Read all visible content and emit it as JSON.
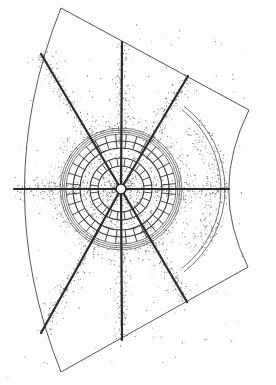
{
  "figure": {
    "style": "pen-and-ink line drawing with stipple shading",
    "colors": {
      "background": "#ffffff",
      "outline": "#444444",
      "rib": "#2a2a2a",
      "ring": "#3a3a3a",
      "stipple": "#7a7a7a"
    },
    "center": [
      121,
      189
    ],
    "sector_outline": {
      "top_left": [
        61,
        8
      ],
      "top_right": [
        249,
        110
      ],
      "bottom_right": [
        248,
        267
      ],
      "bottom_left": [
        61,
        372
      ],
      "left_arc_mid": [
        14,
        190
      ],
      "right_arc_mid": [
        229,
        190
      ]
    },
    "ribs": [
      {
        "name": "north",
        "to": [
          122,
          42
        ]
      },
      {
        "name": "north-west",
        "to": [
          41,
          54
        ]
      },
      {
        "name": "north-east",
        "to": [
          188,
          76
        ]
      },
      {
        "name": "west",
        "to": [
          14,
          189
        ]
      },
      {
        "name": "east",
        "to": [
          229,
          189
        ]
      },
      {
        "name": "south-west",
        "to": [
          41,
          333
        ]
      },
      {
        "name": "south",
        "to": [
          122,
          340
        ]
      },
      {
        "name": "south-east",
        "to": [
          187,
          302
        ]
      }
    ],
    "rings_radii": [
      5,
      23,
      31,
      41,
      48,
      55,
      59
    ],
    "side_arc_bands": [
      {
        "radius": 100
      },
      {
        "radius": 104
      }
    ]
  }
}
